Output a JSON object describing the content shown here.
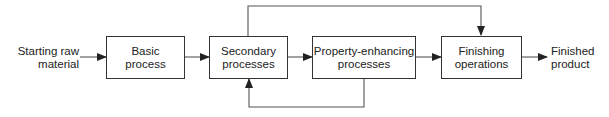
{
  "diagram": {
    "type": "process-flow",
    "input": {
      "line1": "Starting raw",
      "line2": "material"
    },
    "nodes": [
      {
        "id": "basic",
        "line1": "Basic",
        "line2": "process"
      },
      {
        "id": "secondary",
        "line1": "Secondary",
        "line2": "processes"
      },
      {
        "id": "property",
        "line1": "Property-enhancing",
        "line2": "processes"
      },
      {
        "id": "finishing",
        "line1": "Finishing",
        "line2": "operations"
      }
    ],
    "output": {
      "line1": "Finished",
      "line2": "product"
    },
    "edges": [
      [
        "input",
        "basic"
      ],
      [
        "basic",
        "secondary"
      ],
      [
        "secondary",
        "property"
      ],
      [
        "property",
        "finishing"
      ],
      [
        "finishing",
        "output"
      ],
      [
        "secondary",
        "finishing",
        "bypass-over-top"
      ],
      [
        "property",
        "secondary",
        "feedback-loop-bottom"
      ]
    ],
    "colors": {
      "line": "#333333",
      "background": "#ffffff"
    }
  }
}
